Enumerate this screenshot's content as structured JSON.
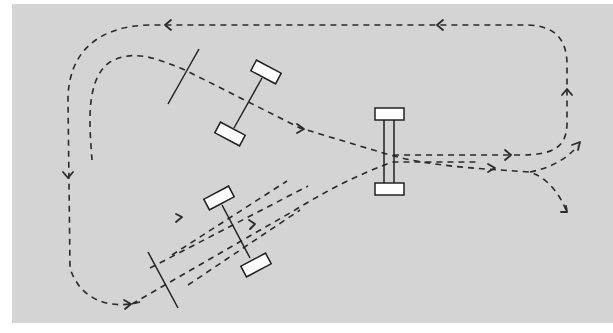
{
  "diagram": {
    "title": "",
    "colors": {
      "background": "#ffffff",
      "panel": "#d4d4d4",
      "stroke": "#2a2a2a",
      "wheel_fill": "#ffffff"
    },
    "elements": {
      "outer_loop": {
        "style": "dashed",
        "direction": "counter-clockwise",
        "arrows": [
          "left-top-1",
          "left-top-2",
          "down-left-side",
          "up-right-side",
          "right-middle",
          "right-bottom"
        ]
      },
      "inner_path": {
        "style": "dashed",
        "arrows": [
          "right-after-car1",
          "right-past-axle",
          "down-right-exit"
        ]
      },
      "branch_path": {
        "style": "dashed",
        "arrows": [
          "up-right-exit"
        ]
      },
      "vehicles": [
        {
          "id": "car-upper-left",
          "orientation": "angled",
          "wheels": 2
        },
        {
          "id": "car-center-vertical",
          "orientation": "vertical",
          "wheels": 2
        },
        {
          "id": "car-lower-left",
          "orientation": "angled",
          "wheels": 2
        }
      ],
      "reference_lines": [
        {
          "id": "ref-line-upper"
        },
        {
          "id": "ref-line-lower"
        }
      ],
      "parallel_tracks": 3
    }
  }
}
